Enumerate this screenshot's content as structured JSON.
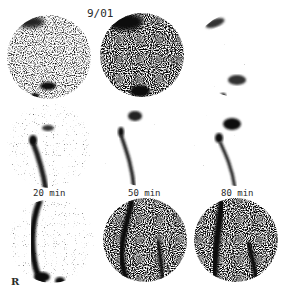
{
  "figure": {
    "title": "9/01",
    "time_labels": [
      "20 min",
      "50 min",
      "80 min"
    ],
    "side_marker": "R",
    "rows": 3,
    "columns": 3,
    "panels": [
      {
        "row": 1,
        "col": 1,
        "description": "static scan, medium-density noise, dark spot at bottom"
      },
      {
        "row": 1,
        "col": 2,
        "description": "static scan, high-density noise, dark spot at bottom"
      },
      {
        "row": 1,
        "col": 3,
        "description": "static scan, low-density, dark blobs lower center"
      },
      {
        "row": 2,
        "col": 1,
        "label": "20 min",
        "description": "dynamic scan with descending dark tract"
      },
      {
        "row": 2,
        "col": 2,
        "label": "50 min",
        "description": "dynamic scan with descending dark tract"
      },
      {
        "row": 2,
        "col": 3,
        "label": "80 min",
        "description": "dynamic scan with descending dark tract"
      },
      {
        "row": 3,
        "col": 1,
        "description": "scan with left vertical tract"
      },
      {
        "row": 3,
        "col": 2,
        "description": "scan with two vertical tracts"
      },
      {
        "row": 3,
        "col": 3,
        "description": "scan with two vertical tracts"
      }
    ],
    "colors": {
      "background": "#ffffff",
      "ink": "#1a1a1a"
    }
  }
}
